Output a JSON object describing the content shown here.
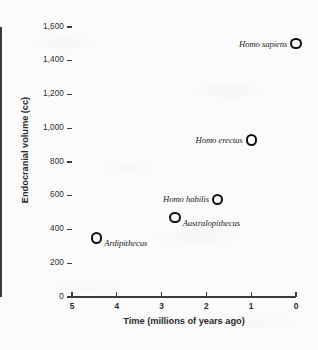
{
  "chart_data": {
    "type": "scatter",
    "title": "",
    "xlabel": "Time (millions of years ago)",
    "ylabel": "Endocranial volume (cc)",
    "xlim": [
      5,
      0
    ],
    "ylim": [
      0,
      1600
    ],
    "x_inverted": true,
    "grid": false,
    "legend": "none",
    "xticks": [
      "5",
      "4",
      "3",
      "2",
      "1",
      "0"
    ],
    "xtick_values": [
      5,
      4,
      3,
      2,
      1,
      0
    ],
    "yticks": [
      "0",
      "200",
      "400",
      "600",
      "800",
      "1,000",
      "1,200",
      "1,400",
      "1,600"
    ],
    "ytick_values": [
      0,
      200,
      400,
      600,
      800,
      1000,
      1200,
      1400,
      1600
    ],
    "marker_style": "open-circle",
    "points": [
      {
        "label": "Ardipithecus",
        "x": 4.45,
        "y": 350,
        "label_position": "right"
      },
      {
        "label": "Australopithecus",
        "x": 2.7,
        "y": 470,
        "label_position": "right"
      },
      {
        "label": "Homo habilis",
        "x": 1.75,
        "y": 580,
        "label_position": "left"
      },
      {
        "label": "Homo erectus",
        "x": 1.0,
        "y": 930,
        "label_position": "left"
      },
      {
        "label": "Homo sapiens",
        "x": 0.0,
        "y": 1500,
        "label_position": "left"
      }
    ]
  },
  "figure": {
    "axis_color": "#3b3b3b",
    "marker_color": "#111111",
    "text_color": "#2b2b2b",
    "background": "#fbfbfb"
  }
}
